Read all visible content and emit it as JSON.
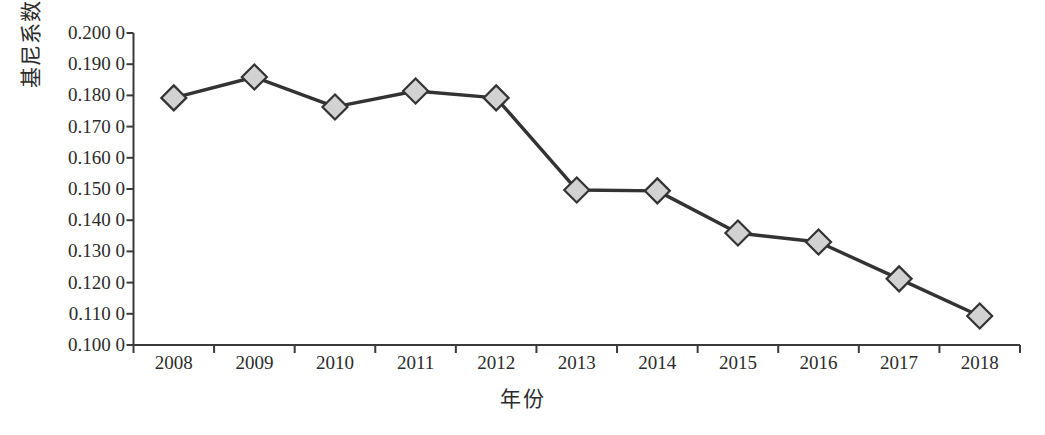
{
  "chart_data": {
    "type": "line",
    "title": "",
    "xlabel": "年份",
    "ylabel": "基尼系数",
    "categories": [
      "2008",
      "2009",
      "2010",
      "2011",
      "2012",
      "2013",
      "2014",
      "2015",
      "2016",
      "2017",
      "2018"
    ],
    "values": [
      0.1792,
      0.1859,
      0.1763,
      0.1814,
      0.1792,
      0.1497,
      0.1494,
      0.1359,
      0.133,
      0.1212,
      0.1093
    ],
    "series": [
      {
        "name": "基尼系数",
        "values": [
          0.1792,
          0.1859,
          0.1763,
          0.1814,
          0.1792,
          0.1497,
          0.1494,
          0.1359,
          0.133,
          0.1212,
          0.1093
        ]
      }
    ],
    "ylim": [
      0.1,
      0.2
    ],
    "ytick_values": [
      0.2,
      0.19,
      0.18,
      0.17,
      0.16,
      0.15,
      0.14,
      0.13,
      0.12,
      0.11,
      0.1
    ],
    "ytick_labels": [
      "0.200 0",
      "0.190 0",
      "0.180 0",
      "0.170 0",
      "0.160 0",
      "0.150 0",
      "0.140 0",
      "0.130 0",
      "0.120 0",
      "0.110 0",
      "0.100 0"
    ],
    "grid": false,
    "legend": "none",
    "marker": "diamond",
    "line_color": "#333333",
    "marker_fill": "#d2d2d2",
    "marker_edge": "#333333"
  },
  "axes": {
    "y_title": "基尼系数",
    "x_title": "年份"
  },
  "caption": {
    "text": ""
  }
}
